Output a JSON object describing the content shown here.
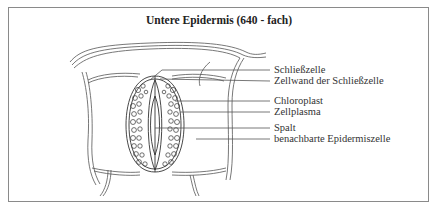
{
  "diagram": {
    "title": "Untere Epidermis (640 - fach)",
    "labels": [
      {
        "text": "Schließzelle",
        "y": 69
      },
      {
        "text": "Zellwand der Schließzelle",
        "y": 80
      },
      {
        "text": "Chloroplast",
        "y": 100
      },
      {
        "text": "Zellplasma",
        "y": 111
      },
      {
        "text": "Spalt",
        "y": 127
      },
      {
        "text": "benachbarte Epidermiszelle",
        "y": 138
      }
    ],
    "colors": {
      "line": "#444444",
      "frame": "#8a8a8a",
      "text": "#333333"
    }
  }
}
